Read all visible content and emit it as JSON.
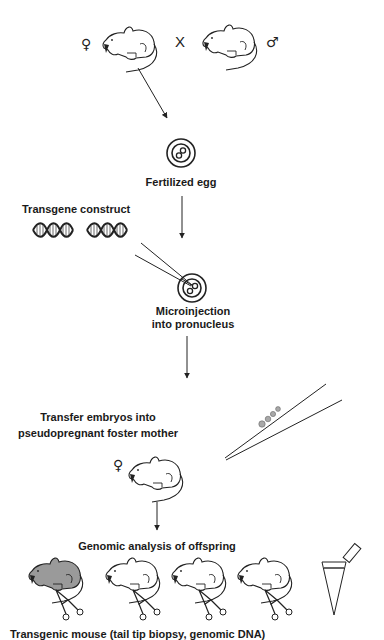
{
  "diagram": {
    "cross": {
      "female_symbol": "♀",
      "cross_symbol": "X",
      "male_symbol": "♂"
    },
    "steps": [
      {
        "id": "fertilized-egg",
        "label": "Fertilized egg"
      },
      {
        "id": "transgene",
        "label": "Transgene construct"
      },
      {
        "id": "microinjection",
        "label_line1": "Microinjection",
        "label_line2": "into pronucleus"
      },
      {
        "id": "transfer",
        "label_line1": "Transfer embryos into",
        "label_line2": "pseudopregnant foster mother",
        "female_symbol": "♀"
      },
      {
        "id": "genomic",
        "label": "Genomic analysis of offspring"
      }
    ],
    "offspring": [
      {
        "transgenic": true
      },
      {
        "transgenic": false
      },
      {
        "transgenic": false
      },
      {
        "transgenic": false
      }
    ],
    "caption": "Transgenic mouse   (tail tip biopsy,   genomic   DNA)",
    "colors": {
      "line": "#222222",
      "transgenic_fill": "#9a9a9a",
      "bead_fill": "#a8a8a8",
      "background": "#ffffff"
    }
  }
}
